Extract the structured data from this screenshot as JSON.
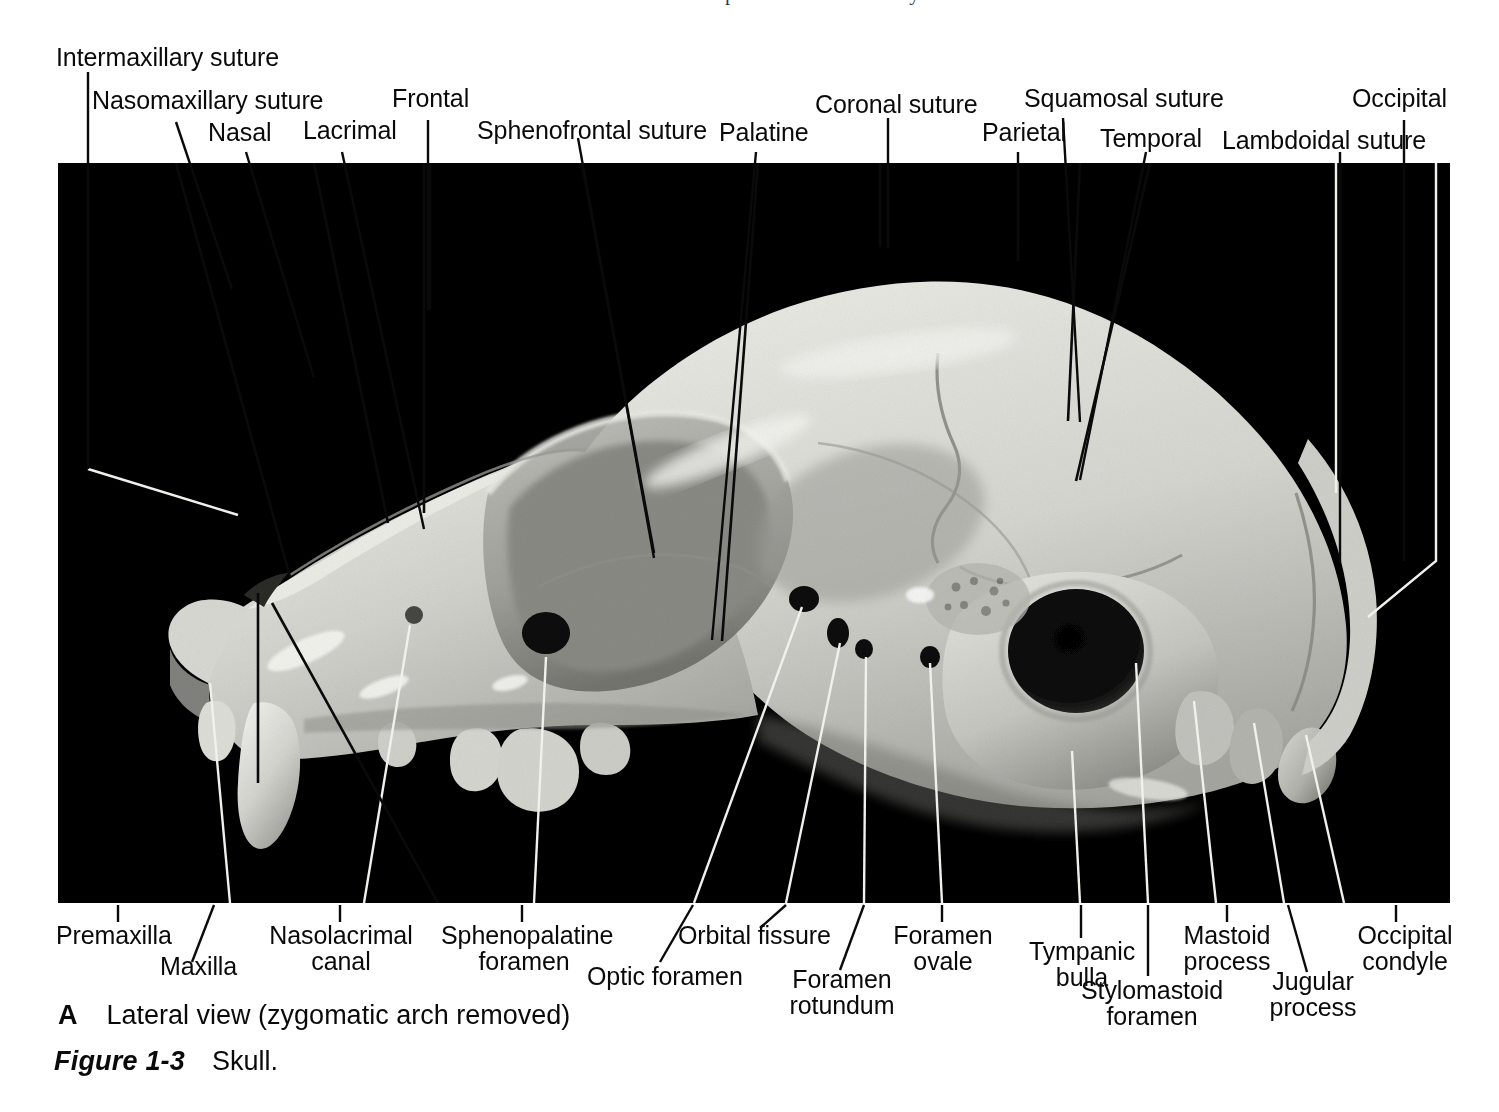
{
  "figure": {
    "header_bleed": "Chapter 1  The Skeletal System",
    "panel_letter": "A",
    "panel_caption": "Lateral view (zygomatic arch removed)",
    "figure_number": "Figure 1-3",
    "figure_title": "Skull.",
    "specimen": "cat skull, lateral view",
    "colors": {
      "page_background": "#ffffff",
      "photo_background": "#000000",
      "bone_light": "#e2e2de",
      "bone_mid": "#c4c4bf",
      "bone_shadow": "#8e8e89",
      "text": "#0a0a0a",
      "leader_dark": "#000000",
      "leader_light": "#f2f2f2"
    }
  },
  "labels_top": [
    {
      "id": "intermaxillary-suture",
      "text": "Intermaxillary suture"
    },
    {
      "id": "nasomaxillary-suture",
      "text": "Nasomaxillary suture"
    },
    {
      "id": "nasal",
      "text": "Nasal"
    },
    {
      "id": "lacrimal",
      "text": "Lacrimal"
    },
    {
      "id": "frontal",
      "text": "Frontal"
    },
    {
      "id": "sphenofrontal-suture",
      "text": "Sphenofrontal suture"
    },
    {
      "id": "palatine",
      "text": "Palatine"
    },
    {
      "id": "coronal-suture",
      "text": "Coronal suture"
    },
    {
      "id": "parietal",
      "text": "Parietal"
    },
    {
      "id": "squamosal-suture",
      "text": "Squamosal suture"
    },
    {
      "id": "temporal",
      "text": "Temporal"
    },
    {
      "id": "lambdoidal-suture",
      "text": "Lambdoidal suture"
    },
    {
      "id": "occipital",
      "text": "Occipital"
    }
  ],
  "labels_bottom": [
    {
      "id": "premaxilla",
      "text": "Premaxilla"
    },
    {
      "id": "maxilla",
      "text": "Maxilla"
    },
    {
      "id": "nasolacrimal-canal",
      "line1": "Nasolacrimal",
      "line2": "canal"
    },
    {
      "id": "sphenopalatine-foramen",
      "line1": "Sphenopalatine",
      "line2": "foramen"
    },
    {
      "id": "optic-foramen",
      "text": "Optic foramen"
    },
    {
      "id": "orbital-fissure",
      "text": "Orbital fissure"
    },
    {
      "id": "foramen-rotundum",
      "line1": "Foramen",
      "line2": "rotundum"
    },
    {
      "id": "foramen-ovale",
      "line1": "Foramen",
      "line2": "ovale"
    },
    {
      "id": "tympanic-bulla",
      "line1": "Tympanic",
      "line2": "bulla"
    },
    {
      "id": "stylomastoid-foramen",
      "line1": "Stylomastoid",
      "line2": "foramen"
    },
    {
      "id": "mastoid-process",
      "line1": "Mastoid",
      "line2": "process"
    },
    {
      "id": "jugular-process",
      "line1": "Jugular",
      "line2": "process"
    },
    {
      "id": "occipital-condyle",
      "line1": "Occipital",
      "line2": "condyle"
    }
  ]
}
